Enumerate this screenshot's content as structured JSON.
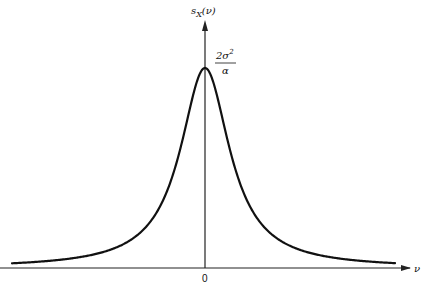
{
  "chart_data": {
    "type": "line",
    "title": "",
    "function": "Lorentzian power spectral density",
    "xlabel": "ν",
    "ylabel": "s_X(ν)",
    "ylabel_parts": {
      "base": "s",
      "sub": "X",
      "arg": "(ν)"
    },
    "x_ticks": [
      "0"
    ],
    "peak_label": {
      "numerator": "2σ²",
      "numerator_base": "2σ",
      "numerator_sup": "2",
      "denominator": "α"
    },
    "peak": {
      "x": 0,
      "y": "2σ²/α"
    },
    "grid": false,
    "legend": null,
    "series": [
      {
        "name": "s_X(ν)",
        "shape": "lorentzian",
        "x": [
          -6.4,
          -4,
          -3,
          -2,
          -1.5,
          -1,
          -0.5,
          0,
          0.5,
          1,
          1.5,
          2,
          3,
          4,
          6.3
        ],
        "y_relative": [
          0.024,
          0.059,
          0.1,
          0.2,
          0.31,
          0.5,
          0.8,
          1.0,
          0.8,
          0.5,
          0.31,
          0.2,
          0.1,
          0.059,
          0.025
        ]
      }
    ]
  },
  "colors": {
    "line": "#111111",
    "axis": "#222222",
    "background": "#ffffff"
  }
}
